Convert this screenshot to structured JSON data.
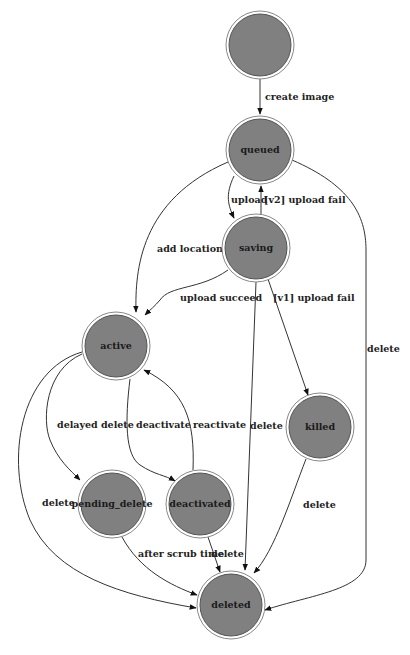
{
  "diagram": {
    "type": "state-machine",
    "colors": {
      "node_fill": "#808080",
      "node_ring": "#ffffff",
      "edge": "#333333",
      "text": "#1a1a1a",
      "background": "#ffffff"
    },
    "nodes": [
      {
        "id": "start",
        "label": ""
      },
      {
        "id": "queued",
        "label": "queued"
      },
      {
        "id": "saving",
        "label": "saving"
      },
      {
        "id": "active",
        "label": "active"
      },
      {
        "id": "killed",
        "label": "killed"
      },
      {
        "id": "pending_delete",
        "label": "pending_delete"
      },
      {
        "id": "deactivated",
        "label": "deactivated"
      },
      {
        "id": "deleted",
        "label": "deleted"
      }
    ],
    "edges": [
      {
        "from": "start",
        "to": "queued",
        "label": "create image"
      },
      {
        "from": "queued",
        "to": "saving",
        "label": "upload"
      },
      {
        "from": "saving",
        "to": "queued",
        "label": "[v2] upload fail"
      },
      {
        "from": "queued",
        "to": "active",
        "label": "add location*"
      },
      {
        "from": "queued",
        "to": "deleted",
        "label": "delete"
      },
      {
        "from": "saving",
        "to": "active",
        "label": "upload succeed"
      },
      {
        "from": "saving",
        "to": "killed",
        "label": "[v1] upload fail"
      },
      {
        "from": "saving",
        "to": "deleted",
        "label": "delete"
      },
      {
        "from": "active",
        "to": "pending_delete",
        "label": "delayed delete"
      },
      {
        "from": "active",
        "to": "deactivated",
        "label": "deactivate"
      },
      {
        "from": "deactivated",
        "to": "active",
        "label": "reactivate"
      },
      {
        "from": "active",
        "to": "deleted",
        "label": "delete"
      },
      {
        "from": "pending_delete",
        "to": "deleted",
        "label": "after scrub time"
      },
      {
        "from": "deactivated",
        "to": "deleted",
        "label": "delete"
      },
      {
        "from": "killed",
        "to": "deleted",
        "label": "delete"
      }
    ]
  }
}
